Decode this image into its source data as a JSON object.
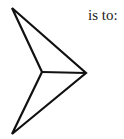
{
  "caption": "is to:",
  "figure": {
    "name": "arrowhead-shape",
    "stroke_color": "#111111",
    "stroke_width": 2.2,
    "outer_polygon": [
      [
        12,
        8
      ],
      [
        86,
        73
      ],
      [
        12,
        134
      ],
      [
        42,
        72
      ]
    ],
    "inner_segment": [
      [
        42,
        72
      ],
      [
        86,
        73
      ]
    ]
  }
}
